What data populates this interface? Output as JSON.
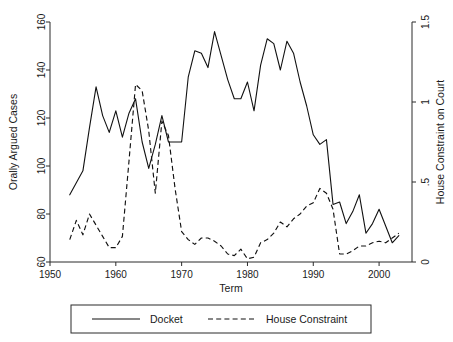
{
  "chart_data": {
    "type": "line",
    "title": "",
    "subtitle": "",
    "xlabel": "Term",
    "ylabel": "Orally Argued Cases",
    "y2label": "House Constraint on Court",
    "xlim": [
      1950,
      2005
    ],
    "ylim": [
      60,
      160
    ],
    "y2lim": [
      0,
      1.5
    ],
    "xticks": [
      1950,
      1960,
      1970,
      1980,
      1990,
      2000
    ],
    "xticklabels": [
      "1950",
      "1960",
      "1970",
      "1980",
      "1990",
      "2000"
    ],
    "yticks": [
      60,
      80,
      100,
      120,
      140,
      160
    ],
    "yticklabels": [
      "60",
      "80",
      "100",
      "120",
      "140",
      "160"
    ],
    "y2ticks": [
      0,
      0.5,
      1,
      1.5
    ],
    "y2ticklabels": [
      "0",
      ".5",
      "1",
      "1.5"
    ],
    "grid": false,
    "legend_position": "below-axes",
    "x": [
      1953,
      1954,
      1955,
      1956,
      1957,
      1958,
      1959,
      1960,
      1961,
      1962,
      1963,
      1964,
      1965,
      1966,
      1967,
      1968,
      1969,
      1970,
      1971,
      1972,
      1973,
      1974,
      1975,
      1976,
      1977,
      1978,
      1979,
      1980,
      1981,
      1982,
      1983,
      1984,
      1985,
      1986,
      1987,
      1988,
      1989,
      1990,
      1991,
      1992,
      1993,
      1994,
      1995,
      1996,
      1997,
      1998,
      1999,
      2000,
      2001,
      2002,
      2003
    ],
    "series": [
      {
        "name": "Docket",
        "style": "solid",
        "axis": "left",
        "values": [
          88,
          93,
          98,
          116,
          133,
          121,
          114,
          123,
          112,
          122,
          128,
          110,
          99,
          109,
          121,
          110,
          110,
          110,
          137,
          148,
          147,
          141,
          156,
          146,
          136,
          128,
          128,
          135,
          123,
          142,
          153,
          151,
          140,
          152,
          147,
          135,
          125,
          113,
          109,
          111,
          84,
          85,
          76,
          81,
          88,
          72,
          76,
          82,
          75,
          68,
          71
        ]
      },
      {
        "name": "House Constraint",
        "style": "dashed",
        "axis": "right",
        "values": [
          0.14,
          0.26,
          0.17,
          0.3,
          0.23,
          0.16,
          0.09,
          0.09,
          0.16,
          0.63,
          1.11,
          1.07,
          0.82,
          0.43,
          0.88,
          0.79,
          0.46,
          0.19,
          0.14,
          0.11,
          0.15,
          0.15,
          0.13,
          0.1,
          0.05,
          0.04,
          0.08,
          0.02,
          0.03,
          0.12,
          0.14,
          0.18,
          0.25,
          0.22,
          0.27,
          0.3,
          0.35,
          0.37,
          0.46,
          0.43,
          0.33,
          0.05,
          0.05,
          0.07,
          0.1,
          0.1,
          0.12,
          0.13,
          0.12,
          0.15,
          0.18
        ]
      }
    ],
    "legend": [
      {
        "label": "Docket",
        "style": "solid"
      },
      {
        "label": "House Constraint",
        "style": "dashed"
      }
    ]
  }
}
